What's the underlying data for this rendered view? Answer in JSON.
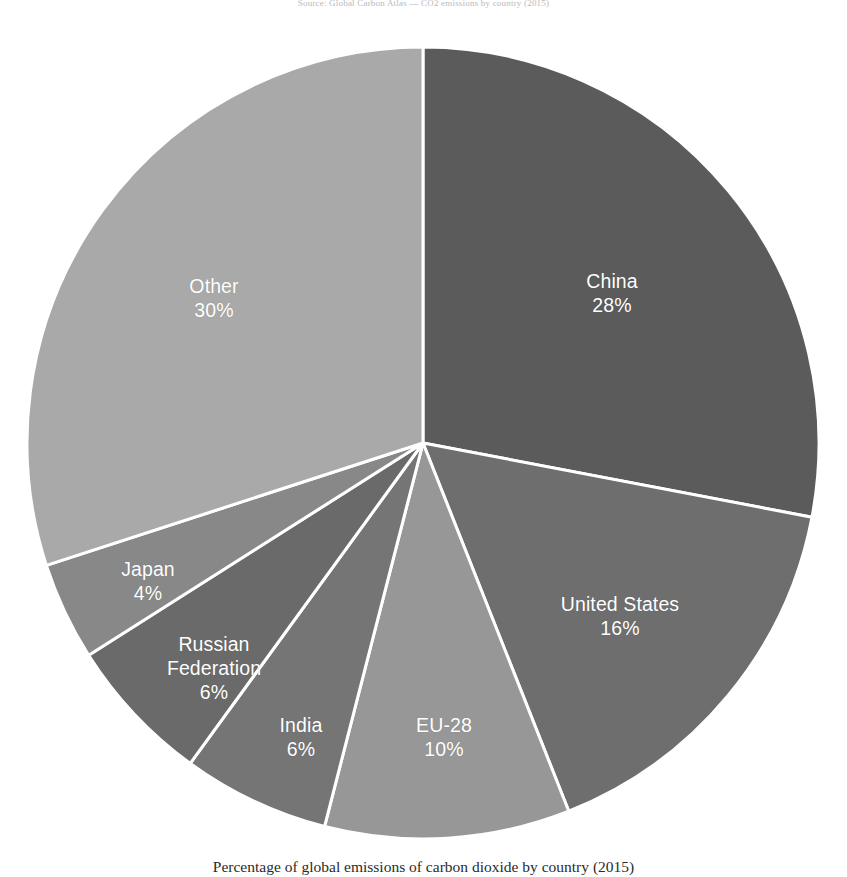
{
  "header_note": "Source: Global Carbon Atlas — CO2 emissions by country (2015)",
  "caption": "Percentage of global emissions of carbon dioxide by country (2015)",
  "colors": {
    "background": "#ffffff",
    "separator": "#ffffff",
    "label_text": "#ffffff",
    "caption_text": "#2b2b2b"
  },
  "chart_data": {
    "type": "pie",
    "title": "",
    "subtitle": "",
    "xlabel": "",
    "ylabel": "",
    "units": "percent",
    "legend_position": "none",
    "grid": false,
    "start_angle_deg": 0,
    "direction": "clockwise",
    "total": 100,
    "categories": [
      "China",
      "United States",
      "EU-28",
      "India",
      "Russian Federation",
      "Japan",
      "Other"
    ],
    "values": [
      28,
      16,
      10,
      6,
      6,
      4,
      30
    ],
    "slices": [
      {
        "label": "China",
        "value": 28,
        "value_label": "28%",
        "color": "#5b5b5b",
        "label_x": 612,
        "label_y": 293
      },
      {
        "label": "United States",
        "value": 16,
        "value_label": "16%",
        "color": "#6e6e6e",
        "label_x": 620,
        "label_y": 616
      },
      {
        "label": "EU-28",
        "value": 10,
        "value_label": "10%",
        "color": "#979797",
        "label_x": 444,
        "label_y": 737
      },
      {
        "label": "India",
        "value": 6,
        "value_label": "6%",
        "color": "#757575",
        "label_x": 301,
        "label_y": 737
      },
      {
        "label": "Russian Federation",
        "value": 6,
        "value_label": "6%",
        "color": "#6a6a6a",
        "label_x": 214,
        "label_y": 668,
        "label_line2": "Federation",
        "label_line1": "Russian"
      },
      {
        "label": "Japan",
        "value": 4,
        "value_label": "4%",
        "color": "#888888",
        "label_x": 148,
        "label_y": 581
      },
      {
        "label": "Other",
        "value": 30,
        "value_label": "30%",
        "color": "#a9a9a9",
        "label_x": 214,
        "label_y": 298
      }
    ]
  },
  "geometry": {
    "center_x": 423,
    "center_y": 443,
    "radius": 396
  }
}
